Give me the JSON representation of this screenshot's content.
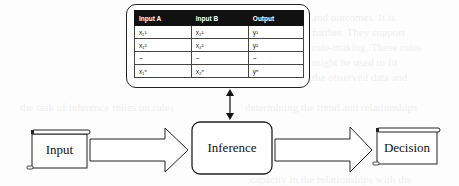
{
  "table": {
    "headers": [
      "Input A",
      "Input B",
      "Output"
    ],
    "rows": [
      [
        "x₁¹",
        "x₂¹",
        "y¹"
      ],
      [
        "x₁²",
        "x₂²",
        "y²"
      ],
      [
        "~",
        "~",
        "~"
      ],
      [
        "x₁ⁿ",
        "x₂ⁿ",
        "yⁿ"
      ]
    ]
  },
  "nodes": {
    "input": "Input",
    "inference": "Inference",
    "decision": "Decision"
  },
  "colors": {
    "stroke": "#222222",
    "header_bg": "#111111",
    "background": "#fdfdfd"
  }
}
